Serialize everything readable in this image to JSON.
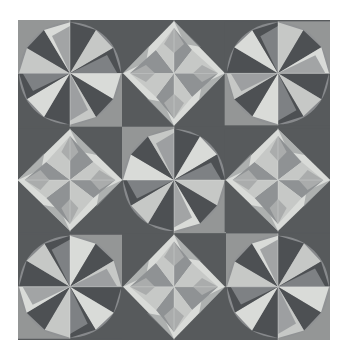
{
  "artwork": {
    "title": "Grayscale Quilt Block Pattern",
    "medium": "geometric tiled pattern",
    "canvas": {
      "width": 348,
      "height": 360,
      "background_color": "#ffffff"
    },
    "pattern_area": {
      "x": 18,
      "y": 20,
      "width": 312,
      "height": 320,
      "rows": 3,
      "cols": 3,
      "tile_width": 104,
      "tile_height": 106.7
    }
  },
  "palette": {
    "page_background": "#ffffff",
    "tile_background_dark": "#575a5c",
    "dark": "#4d5053",
    "dark_alt": "#5e6164",
    "mid": "#8f9294",
    "mid_light": "#aaacac",
    "light": "#c6c8c6",
    "lightest": "#d9dbd8",
    "seam_line": "#e6e8e6"
  },
  "motifs": {
    "pinwheel_star": {
      "name": "circular-eight-point-pinwheel",
      "description": "Eight-point pinwheel star inscribed in a circle; each quadrant holds a rotated half-square triangle pair."
    },
    "diamond_star": {
      "name": "diamond-on-point-star",
      "description": "Light square-on-point containing an eight-point star with alternating light and mid-tone rays."
    }
  },
  "grid": {
    "tiles": [
      {
        "row": 0,
        "col": 0,
        "motif": "pinwheel_star",
        "rotation": 0,
        "label": "top-left-pinwheel"
      },
      {
        "row": 0,
        "col": 1,
        "motif": "diamond_star",
        "rotation": 0,
        "label": "top-center-diamond"
      },
      {
        "row": 0,
        "col": 2,
        "motif": "pinwheel_star",
        "rotation": 90,
        "label": "top-right-pinwheel"
      },
      {
        "row": 1,
        "col": 0,
        "motif": "diamond_star",
        "rotation": 90,
        "label": "middle-left-diamond"
      },
      {
        "row": 1,
        "col": 1,
        "motif": "pinwheel_star",
        "rotation": 180,
        "label": "center-pinwheel"
      },
      {
        "row": 1,
        "col": 2,
        "motif": "diamond_star",
        "rotation": 270,
        "label": "middle-right-diamond"
      },
      {
        "row": 2,
        "col": 0,
        "motif": "pinwheel_star",
        "rotation": 270,
        "label": "bottom-left-pinwheel"
      },
      {
        "row": 2,
        "col": 1,
        "motif": "diamond_star",
        "rotation": 180,
        "label": "bottom-center-diamond"
      },
      {
        "row": 2,
        "col": 2,
        "motif": "pinwheel_star",
        "rotation": 0,
        "label": "bottom-right-pinwheel"
      }
    ]
  }
}
